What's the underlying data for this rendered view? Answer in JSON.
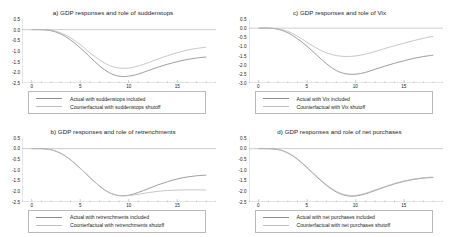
{
  "figure": {
    "background": "#ffffff",
    "actual_color": "#8d8d8d",
    "counterfactual_color": "#bdbdbd",
    "axis_color": "#9a9a9a"
  },
  "panels": [
    {
      "id": "panel-a",
      "title": "a) GDP responses and role of  suddenstops",
      "legend": [
        {
          "label": "Actual with  suddenstops included",
          "color": "#8d8d8d"
        },
        {
          "label": "Counterfactual with  suddenstops shutoff",
          "color": "#bdbdbd"
        }
      ],
      "chart_data": {
        "type": "line",
        "title": "a) GDP responses and role of  suddenstops",
        "xlabel": "",
        "ylabel": "",
        "xlim": [
          -1,
          19
        ],
        "ylim": [
          -2.5,
          0.5
        ],
        "grid": false,
        "legend_position": "below",
        "yticks": [
          "0.5",
          "0.0",
          "-0.5",
          "-1.0",
          "-1.5",
          "-2.0",
          "-2.5"
        ],
        "xticks": [
          "0",
          "5",
          "10",
          "15"
        ],
        "x": [
          0,
          1,
          2,
          3,
          4,
          5,
          6,
          7,
          8,
          9,
          10,
          11,
          12,
          13,
          14,
          15,
          16,
          17,
          18
        ],
        "series": [
          {
            "name": "Actual with  suddenstops included",
            "values": [
              0.0,
              0.0,
              -0.05,
              -0.2,
              -0.48,
              -0.85,
              -1.28,
              -1.7,
              -2.02,
              -2.18,
              -2.18,
              -2.08,
              -1.92,
              -1.76,
              -1.62,
              -1.5,
              -1.4,
              -1.33,
              -1.28
            ]
          },
          {
            "name": "Counterfactual with  suddenstops shutoff",
            "values": [
              0.0,
              0.0,
              -0.03,
              -0.15,
              -0.38,
              -0.7,
              -1.08,
              -1.42,
              -1.68,
              -1.8,
              -1.8,
              -1.7,
              -1.55,
              -1.38,
              -1.22,
              -1.08,
              -0.96,
              -0.88,
              -0.82
            ]
          }
        ]
      }
    },
    {
      "id": "panel-c",
      "title": "c) GDP responses and role of Vix",
      "legend": [
        {
          "label": "Actual with  Vix included",
          "color": "#8d8d8d"
        },
        {
          "label": "Counterfactual with Vix shutoff",
          "color": "#bdbdbd"
        }
      ],
      "chart_data": {
        "type": "line",
        "title": "c) GDP responses and role of Vix",
        "xlabel": "",
        "ylabel": "",
        "xlim": [
          -1,
          19
        ],
        "ylim": [
          -3.0,
          0.5
        ],
        "grid": false,
        "legend_position": "below",
        "yticks": [
          "0.5",
          "0.0",
          "-0.5",
          "-1.0",
          "-1.5",
          "-2.0",
          "-2.5",
          "-3.0"
        ],
        "xticks": [
          "0",
          "5",
          "10",
          "15"
        ],
        "x": [
          0,
          1,
          2,
          3,
          4,
          5,
          6,
          7,
          8,
          9,
          10,
          11,
          12,
          13,
          14,
          15,
          16,
          17,
          18
        ],
        "series": [
          {
            "name": "Actual with  Vix included",
            "values": [
              0.0,
              0.0,
              -0.06,
              -0.25,
              -0.58,
              -1.0,
              -1.48,
              -1.95,
              -2.32,
              -2.5,
              -2.52,
              -2.42,
              -2.25,
              -2.08,
              -1.92,
              -1.78,
              -1.65,
              -1.55,
              -1.48
            ]
          },
          {
            "name": "Counterfactual with Vix shutoff",
            "values": [
              0.0,
              0.0,
              -0.04,
              -0.18,
              -0.44,
              -0.78,
              -1.1,
              -1.35,
              -1.5,
              -1.55,
              -1.52,
              -1.42,
              -1.28,
              -1.12,
              -0.96,
              -0.82,
              -0.68,
              -0.55,
              -0.45
            ]
          }
        ]
      }
    },
    {
      "id": "panel-b",
      "title": "b) GDP responses and role of retrenchments",
      "legend": [
        {
          "label": "Actual with  retrenchments included",
          "color": "#8d8d8d"
        },
        {
          "label": "Counterfactual with  retrenchments shutoff",
          "color": "#bdbdbd"
        }
      ],
      "chart_data": {
        "type": "line",
        "title": "b) GDP responses and role of retrenchments",
        "xlabel": "",
        "ylabel": "",
        "xlim": [
          -1,
          19
        ],
        "ylim": [
          -2.5,
          0.5
        ],
        "grid": false,
        "legend_position": "below",
        "yticks": [
          "0.5",
          "0.0",
          "-0.5",
          "-1.0",
          "-1.5",
          "-2.0",
          "-2.5"
        ],
        "xticks": [
          "0",
          "5",
          "10",
          "15"
        ],
        "x": [
          0,
          1,
          2,
          3,
          4,
          5,
          6,
          7,
          8,
          9,
          10,
          11,
          12,
          13,
          14,
          15,
          16,
          17,
          18
        ],
        "series": [
          {
            "name": "Actual with  retrenchments included",
            "values": [
              0.0,
              0.0,
              -0.05,
              -0.22,
              -0.52,
              -0.92,
              -1.35,
              -1.76,
              -2.06,
              -2.2,
              -2.18,
              -2.05,
              -1.88,
              -1.7,
              -1.55,
              -1.42,
              -1.33,
              -1.27,
              -1.24
            ]
          },
          {
            "name": "Counterfactual with  retrenchments shutoff",
            "values": [
              0.0,
              0.0,
              -0.05,
              -0.22,
              -0.52,
              -0.92,
              -1.35,
              -1.76,
              -2.06,
              -2.2,
              -2.2,
              -2.14,
              -2.06,
              -2.0,
              -1.96,
              -1.94,
              -1.93,
              -1.93,
              -1.94
            ]
          }
        ]
      }
    },
    {
      "id": "panel-d",
      "title": "d) GDP responses and role of net purchases",
      "legend": [
        {
          "label": "Actual with net purchases included",
          "color": "#8d8d8d"
        },
        {
          "label": "Counterfactual with net purchases shutoff",
          "color": "#bdbdbd"
        }
      ],
      "chart_data": {
        "type": "line",
        "title": "d) GDP responses and role of net purchases",
        "xlabel": "",
        "ylabel": "",
        "xlim": [
          -1,
          19
        ],
        "ylim": [
          -2.5,
          0.5
        ],
        "grid": false,
        "legend_position": "below",
        "yticks": [
          "0.5",
          "0.0",
          "-0.5",
          "-1.0",
          "-1.5",
          "-2.0",
          "-2.5"
        ],
        "xticks": [
          "0",
          "5",
          "10",
          "15"
        ],
        "x": [
          0,
          1,
          2,
          3,
          4,
          5,
          6,
          7,
          8,
          9,
          10,
          11,
          12,
          13,
          14,
          15,
          16,
          17,
          18
        ],
        "series": [
          {
            "name": "Actual with net purchases included",
            "values": [
              0.0,
              0.0,
              -0.04,
              -0.2,
              -0.5,
              -0.9,
              -1.33,
              -1.73,
              -2.03,
              -2.2,
              -2.22,
              -2.12,
              -1.96,
              -1.8,
              -1.65,
              -1.53,
              -1.44,
              -1.38,
              -1.35
            ]
          },
          {
            "name": "Counterfactual with net purchases shutoff",
            "values": [
              0.0,
              0.0,
              -0.04,
              -0.19,
              -0.48,
              -0.88,
              -1.3,
              -1.7,
              -2.0,
              -2.17,
              -2.19,
              -2.09,
              -1.94,
              -1.78,
              -1.63,
              -1.51,
              -1.42,
              -1.36,
              -1.33
            ]
          }
        ]
      }
    }
  ]
}
